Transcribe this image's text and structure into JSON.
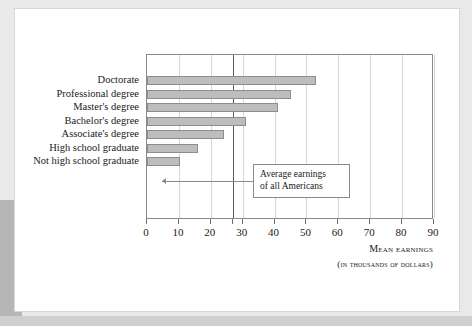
{
  "figure": {
    "annotation": {
      "line1": "Average earnings",
      "line2": "of all Americans"
    },
    "axis_title": "Mean earnings",
    "axis_subtitle": "(in thousands of dollars)"
  },
  "chart_data": {
    "type": "bar",
    "orientation": "horizontal",
    "title": "",
    "xlabel": "Mean earnings",
    "xlabel_sub": "(in thousands of dollars)",
    "ylabel": "",
    "categories": [
      "Doctorate",
      "Professional degree",
      "Master's degree",
      "Bachelor's degree",
      "Associate's degree",
      "High school graduate",
      "Not high school graduate"
    ],
    "values": [
      53,
      45,
      41,
      31,
      24,
      16,
      10.5
    ],
    "xlim": [
      0,
      90
    ],
    "xticks": [
      0,
      10,
      20,
      30,
      40,
      50,
      60,
      70,
      80,
      90
    ],
    "xticklabels": [
      "0",
      "10",
      "20",
      "30",
      "40",
      "50",
      "60",
      "70",
      "80",
      "90"
    ],
    "extra_tick": 27,
    "grid": "vertical",
    "legend": "none",
    "bar_color": "#bdbdbd",
    "bar_edge_color": "#8d8d8d",
    "reference_line": {
      "value": 27,
      "color": "#5a5a5a",
      "label": "Average earnings of all Americans"
    },
    "annotations": [
      {
        "text": "Average earnings of all Americans",
        "points_to": 27
      }
    ]
  }
}
